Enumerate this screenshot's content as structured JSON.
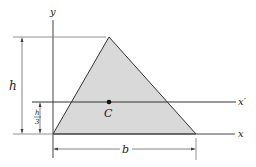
{
  "diagram": {
    "type": "triangle-centroid",
    "colors": {
      "fill": "#d9d9d9",
      "stroke": "#333333",
      "axis": "#555555",
      "dim": "#666666"
    },
    "labels": {
      "y_axis": "y",
      "x_axis": "x",
      "x_prime": "x′",
      "centroid": "C",
      "height": "h",
      "height_third_num": "h",
      "height_third_den": "3",
      "base": "b"
    },
    "geometry": {
      "apex": [
        109,
        37
      ],
      "base_left": [
        53,
        134
      ],
      "base_right": [
        196,
        134
      ],
      "centroid": [
        109,
        102
      ]
    }
  }
}
